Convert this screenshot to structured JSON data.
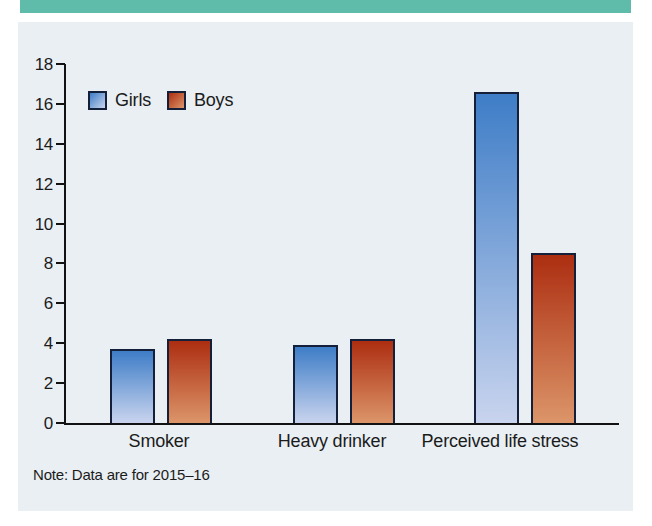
{
  "chart_data": {
    "type": "bar",
    "title": "",
    "xlabel": "",
    "ylabel": "",
    "categories": [
      "Smoker",
      "Heavy drinker",
      "Perceived life stress"
    ],
    "series": [
      {
        "name": "Girls",
        "values": [
          3.7,
          3.9,
          16.6
        ],
        "color_top": "#3E7DC7",
        "color_bottom": "#C9D4EE"
      },
      {
        "name": "Boys",
        "values": [
          4.2,
          4.2,
          8.5
        ],
        "color_top": "#AC2E11",
        "color_bottom": "#DC9569"
      }
    ],
    "ylim": [
      0,
      18
    ],
    "ytick_step": 2,
    "grid": false,
    "legend_position": "top-left",
    "note": "Note: Data are for 2015–16"
  },
  "colors": {
    "accent_band": "#5FBCAB",
    "panel_bg": "#E9EFF3",
    "bar_border": "#14203A",
    "axis": "#121212",
    "text": "#1B1B1B"
  }
}
